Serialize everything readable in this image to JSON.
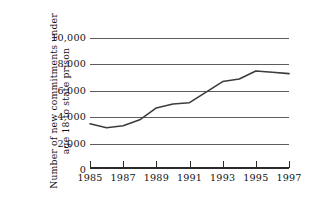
{
  "chart_data": {
    "type": "line",
    "title": "",
    "xlabel": "",
    "ylabel": "Number of new commitments under age 18 to state prison",
    "ylabel_line1": "Number of new commitments under",
    "ylabel_line2": "age 18 to state prison",
    "x": [
      1985,
      1986,
      1987,
      1988,
      1989,
      1990,
      1991,
      1992,
      1993,
      1994,
      1995,
      1996,
      1997
    ],
    "values": [
      3500,
      3200,
      3350,
      3800,
      4700,
      5000,
      5100,
      5900,
      6700,
      6900,
      7500,
      7400,
      7300
    ],
    "series": [
      {
        "name": "New commitments under age 18 to state prison",
        "values": [
          3500,
          3200,
          3350,
          3800,
          4700,
          5000,
          5100,
          5900,
          6700,
          6900,
          7500,
          7400,
          7300
        ]
      }
    ],
    "xlim": [
      1985,
      1997
    ],
    "ylim": [
      0,
      10000
    ],
    "xticks": [
      1985,
      1987,
      1989,
      1991,
      1993,
      1995,
      1997
    ],
    "xtick_labels": [
      "1985",
      "1987",
      "1989",
      "1991",
      "1993",
      "1995",
      "1997"
    ],
    "yticks": [
      0,
      2000,
      4000,
      6000,
      8000,
      10000
    ],
    "ytick_labels": [
      "0",
      "2,000",
      "4,000",
      "6,000",
      "8,000",
      "10,000"
    ],
    "grid": true,
    "grid_axis": "y",
    "legend": false,
    "legend_position": "none",
    "line_color": "#3c3c3c",
    "grid_color": "#5d5d5d",
    "axis_color": "#2b2b2b",
    "background_color": "#ffffff"
  }
}
